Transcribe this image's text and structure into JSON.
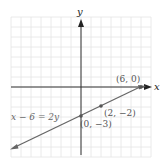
{
  "graph": {
    "x_axis_label": "x",
    "y_axis_label": "y",
    "equation_label": "x − 6 = 2y",
    "points": [
      {
        "label": "(6, 0)",
        "x": 6,
        "y": 0
      },
      {
        "label": "(2, −2)",
        "x": 2,
        "y": -2
      },
      {
        "label": "(0, −3)",
        "x": 0,
        "y": -3
      }
    ],
    "grid": {
      "xmin": -7,
      "xmax": 7,
      "ymin": -7,
      "ymax": 7,
      "step": 1
    },
    "colors": {
      "grid": "#e4e4e4",
      "axis": "#333333",
      "line": "#666666",
      "point": "#555555"
    }
  }
}
